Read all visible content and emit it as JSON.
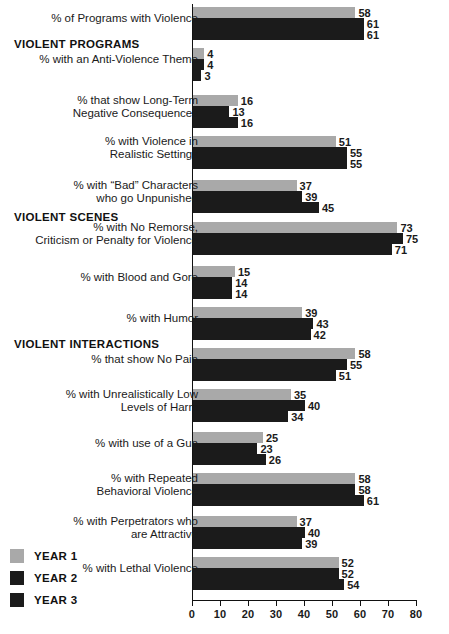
{
  "chart_data": {
    "type": "bar",
    "orientation": "horizontal",
    "title": "",
    "xlabel": "",
    "ylabel": "",
    "xlim": [
      0,
      80
    ],
    "xticks": [
      0,
      10,
      20,
      30,
      40,
      50,
      60,
      70,
      80
    ],
    "grid": false,
    "legend_position": "bottom-left",
    "series": [
      {
        "name": "YEAR 1",
        "color": "#a9a9a9",
        "values": [
          58,
          4,
          16,
          51,
          37,
          73,
          15,
          39,
          58,
          35,
          25,
          58,
          37,
          52
        ]
      },
      {
        "name": "YEAR 2",
        "color": "#1b1b1b",
        "values": [
          61,
          4,
          13,
          55,
          39,
          75,
          14,
          43,
          55,
          40,
          23,
          58,
          40,
          52
        ]
      },
      {
        "name": "YEAR 3",
        "color": "#1b1b1b",
        "values": [
          61,
          3,
          16,
          55,
          45,
          71,
          14,
          42,
          51,
          34,
          26,
          61,
          39,
          54
        ]
      }
    ],
    "categories": [
      "% of Programs with Violence",
      "% with an Anti-Violence Theme",
      "% that show Long-Term\nNegative Consequences",
      "% with Violence in\nRealistic Settings",
      "% with “Bad” Characters\nwho go Unpunished",
      "% with No Remorse,\nCriticism or Penalty for Violence",
      "% with Blood and Gore",
      "% with Humor",
      "% that show No Pain",
      "% with Unrealistically Low\nLevels of Harm",
      "% with use of a Gun",
      "% with Repeated\nBehavioral Violence",
      "% with Perpetrators who\nare Attractive",
      "% with Lethal Violence"
    ],
    "section_headings": [
      {
        "label": "VIOLENT PROGRAMS",
        "before_category_index": 1
      },
      {
        "label": "VIOLENT SCENES",
        "before_category_index": 5
      },
      {
        "label": "VIOLENT INTERACTIONS",
        "before_category_index": 8
      }
    ]
  },
  "layout": {
    "groups": [
      {
        "top": 7,
        "label_top": 12
      },
      {
        "top": 48,
        "label_top": 53
      },
      {
        "top": 95,
        "label_top": 94
      },
      {
        "top": 136,
        "label_top": 135
      },
      {
        "top": 180,
        "label_top": 179
      },
      {
        "top": 222,
        "label_top": 221
      },
      {
        "top": 266,
        "label_top": 271
      },
      {
        "top": 307,
        "label_top": 312
      },
      {
        "top": 348,
        "label_top": 353
      },
      {
        "top": 389,
        "label_top": 388
      },
      {
        "top": 432,
        "label_top": 437
      },
      {
        "top": 473,
        "label_top": 472
      },
      {
        "top": 516,
        "label_top": 515
      },
      {
        "top": 557,
        "label_top": 562
      }
    ],
    "section_tops": [
      38,
      211,
      338
    ],
    "legend_tops": [
      549,
      571,
      593
    ]
  }
}
